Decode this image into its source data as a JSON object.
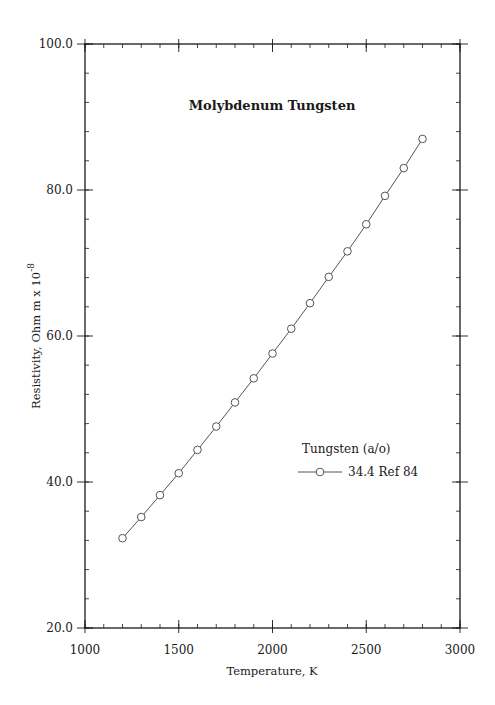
{
  "chart_data": {
    "type": "line",
    "title": "Molybdenum  Tungsten",
    "xlabel": "Temperature,  K",
    "ylabel": "Resistivity, Ohm m x 10",
    "ylabel_superscript": "-8",
    "xlim": [
      1000,
      3000
    ],
    "ylim": [
      20.0,
      100.0
    ],
    "x_ticks": [
      1000,
      1500,
      2000,
      2500,
      3000
    ],
    "x_tick_labels": [
      "1000",
      "1500",
      "2000",
      "2500",
      "3000"
    ],
    "y_ticks": [
      20.0,
      40.0,
      60.0,
      80.0,
      100.0
    ],
    "y_tick_labels": [
      "20.0",
      "40.0",
      "60.0",
      "80.0",
      "100.0"
    ],
    "x_minor_step": 100,
    "y_minor_step": 4,
    "grid": false,
    "legend": {
      "title": "Tungsten (a/o)",
      "position": "inside-right",
      "entries": [
        "34.4 Ref 84"
      ]
    },
    "series": [
      {
        "name": "34.4 Ref 84",
        "marker": "open-circle",
        "x": [
          1200,
          1300,
          1400,
          1500,
          1600,
          1700,
          1800,
          1900,
          2000,
          2100,
          2200,
          2300,
          2400,
          2500,
          2600,
          2700,
          2800
        ],
        "values": [
          32.3,
          35.2,
          38.2,
          41.2,
          44.4,
          47.6,
          50.9,
          54.2,
          57.6,
          61.0,
          64.5,
          68.1,
          71.6,
          75.3,
          79.2,
          83.0,
          87.0
        ]
      }
    ]
  },
  "colors": {
    "axis": "#1a1a1a",
    "series_line": "#555555",
    "marker": "#555555",
    "background": "#ffffff"
  }
}
